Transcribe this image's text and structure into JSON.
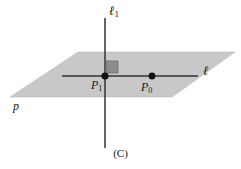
{
  "figure": {
    "caption": "(C)",
    "background_color": "#ffffff",
    "plane": {
      "name": "p",
      "label": "p",
      "fill_color": "#c8c8c8",
      "stroke_color": "#b4b4b4",
      "corners": [
        {
          "x": 78,
          "y": 52
        },
        {
          "x": 235,
          "y": 52
        },
        {
          "x": 172,
          "y": 97
        },
        {
          "x": 10,
          "y": 97
        }
      ]
    },
    "lines": [
      {
        "id": "ell",
        "label_base": "ℓ",
        "label_sub": "",
        "orientation": "horizontal",
        "description": "line lying in the plane",
        "color": "#333333",
        "x1": 62,
        "y1": 76,
        "x2": 198,
        "y2": 76,
        "label_x": 203,
        "label_y": 64
      },
      {
        "id": "ell1",
        "label_base": "ℓ",
        "label_sub": "1",
        "orientation": "vertical",
        "description": "line perpendicular to the plane",
        "color": "#333333",
        "x1": 105,
        "y1": 18,
        "x2": 105,
        "y2": 148,
        "label_x": 109,
        "label_y": 4
      }
    ],
    "points": [
      {
        "id": "p1",
        "label_base": "P",
        "label_sub": "1",
        "x": 105,
        "y": 76,
        "radius": 3.6,
        "color": "#111111",
        "label_x": 91,
        "label_y": 79
      },
      {
        "id": "p0",
        "label_base": "P",
        "label_sub": "0",
        "x": 152,
        "y": 76,
        "radius": 3.4,
        "color": "#111111",
        "label_x": 141,
        "label_y": 81
      }
    ],
    "right_angle_marker": {
      "name": "right-angle-square",
      "x": 106,
      "y": 61,
      "width": 12,
      "height": 12,
      "fill_color": "#8c8c8c",
      "stroke_color": "#6e6e6e"
    }
  }
}
